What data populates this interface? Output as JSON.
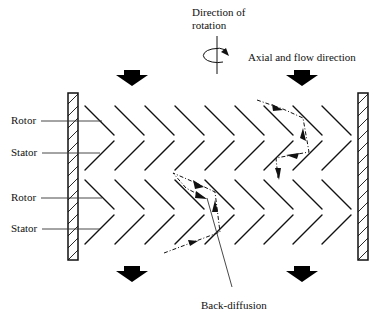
{
  "labels": {
    "direction_of_rotation_line1": "Direction of",
    "direction_of_rotation_line2": "rotation",
    "axial_flow": "Axial and flow direction",
    "rotor_1": "Rotor",
    "stator_1": "Stator",
    "rotor_2": "Rotor",
    "stator_2": "Stator",
    "back_diffusion": "Back-diffusion"
  },
  "geometry": {
    "columns_x": [
      72,
      117,
      161,
      205,
      249,
      293,
      337
    ],
    "column_pitch": 44.5,
    "blade_rows": [
      {
        "type": "rotor",
        "y_top": 105,
        "y_bottom": 138
      },
      {
        "type": "stator",
        "y_top": 138,
        "y_bottom": 170
      },
      {
        "type": "rotor",
        "y_top": 180,
        "y_bottom": 212
      },
      {
        "type": "stator",
        "y_top": 212,
        "y_bottom": 245
      }
    ],
    "walls": [
      {
        "x": 68,
        "y": 93,
        "w": 10,
        "h": 167
      },
      {
        "x": 358,
        "y": 93,
        "w": 10,
        "h": 167
      }
    ],
    "flow_arrows": [
      {
        "x": 132,
        "y": 73
      },
      {
        "x": 302,
        "y": 73
      },
      {
        "x": 132,
        "y": 268
      },
      {
        "x": 302,
        "y": 268
      }
    ]
  },
  "colors": {
    "ink": "#111111",
    "background": "#ffffff"
  }
}
